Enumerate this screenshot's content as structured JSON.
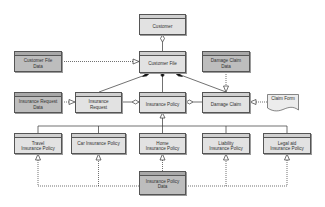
{
  "diagram": {
    "type": "UML class diagram",
    "nodes": {
      "customer": {
        "label": "Customer"
      },
      "customer_file": {
        "label": "Customer File"
      },
      "customer_file_data": {
        "label": "Customer File\nData"
      },
      "damage_claim_data": {
        "label": "Damage Claim\nData"
      },
      "insurance_request_data": {
        "label": "Insurance Request\nData"
      },
      "insurance_request": {
        "label": "Insurance\nRequest"
      },
      "insurance_policy": {
        "label": "Insurance Policy"
      },
      "damage_claim": {
        "label": "Damage Claim"
      },
      "claim_form": {
        "label": "Claim Form"
      },
      "travel_policy": {
        "label": "Travel\nInsurance Policy"
      },
      "car_policy": {
        "label": "Car Insurance Policy"
      },
      "home_policy": {
        "label": "Home\nInsurance Policy"
      },
      "liability_policy": {
        "label": "Liability\nInsurance Policy"
      },
      "legal_aid_policy": {
        "label": "Legal aid\nInsurance Policy"
      },
      "insurance_policy_data": {
        "label": "Insurance Policy\nData"
      }
    },
    "edges": [
      {
        "from": "customer_file",
        "to": "customer",
        "type": "aggregation"
      },
      {
        "from": "customer_file_data",
        "to": "customer_file",
        "type": "realization"
      },
      {
        "from": "insurance_request",
        "to": "customer_file",
        "type": "composition"
      },
      {
        "from": "insurance_policy",
        "to": "customer_file",
        "type": "composition"
      },
      {
        "from": "damage_claim",
        "to": "customer_file",
        "type": "composition"
      },
      {
        "from": "damage_claim_data",
        "to": "damage_claim",
        "type": "realization"
      },
      {
        "from": "insurance_request_data",
        "to": "insurance_request",
        "type": "realization"
      },
      {
        "from": "insurance_request",
        "to": "insurance_policy",
        "type": "aggregation"
      },
      {
        "from": "damage_claim",
        "to": "insurance_policy",
        "type": "aggregation"
      },
      {
        "from": "claim_form",
        "to": "damage_claim",
        "type": "realization"
      },
      {
        "from": "travel_policy",
        "to": "insurance_policy",
        "type": "generalization"
      },
      {
        "from": "car_policy",
        "to": "insurance_policy",
        "type": "generalization"
      },
      {
        "from": "home_policy",
        "to": "insurance_policy",
        "type": "generalization"
      },
      {
        "from": "liability_policy",
        "to": "insurance_policy",
        "type": "generalization"
      },
      {
        "from": "legal_aid_policy",
        "to": "insurance_policy",
        "type": "generalization"
      },
      {
        "from": "insurance_policy_data",
        "to": "travel_policy",
        "type": "realization"
      },
      {
        "from": "insurance_policy_data",
        "to": "car_policy",
        "type": "realization"
      },
      {
        "from": "insurance_policy_data",
        "to": "home_policy",
        "type": "realization"
      },
      {
        "from": "insurance_policy_data",
        "to": "liability_policy",
        "type": "realization"
      },
      {
        "from": "insurance_policy_data",
        "to": "legal_aid_policy",
        "type": "realization"
      }
    ]
  },
  "colors": {
    "class_fill": "#e2e2e2",
    "data_fill": "#bdbdbd",
    "stroke": "#555555"
  }
}
